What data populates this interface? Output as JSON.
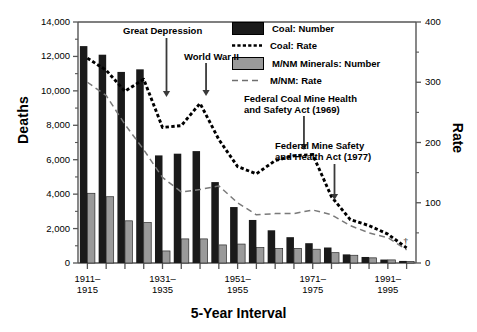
{
  "chart_data": {
    "type": "bar",
    "title": "",
    "xlabel": "5-Year Interval",
    "ylabel": "Deaths",
    "ylabel_right": "Rate",
    "ylim": [
      0,
      14000
    ],
    "ylim_right": [
      0,
      400
    ],
    "ytick_labels": [
      "0",
      "2,000",
      "4,000",
      "6,000",
      "8,000",
      "10,000",
      "12,000",
      "14,000"
    ],
    "ytick_values": [
      0,
      2000,
      4000,
      6000,
      8000,
      10000,
      12000,
      14000
    ],
    "ytick_labels_right": [
      "0",
      "100",
      "200",
      "300",
      "400"
    ],
    "ytick_values_right": [
      0,
      100,
      200,
      300,
      400
    ],
    "grid": false,
    "legend_position": "top-right",
    "categories": [
      "1911-1915",
      "1916-1920",
      "1921-1925",
      "1926-1930",
      "1931-1935",
      "1936-1940",
      "1941-1945",
      "1946-1950",
      "1951-1955",
      "1956-1960",
      "1961-1965",
      "1966-1970",
      "1971-1975",
      "1976-1980",
      "1981-1985",
      "1986-1990",
      "1991-1995",
      "1996-2000"
    ],
    "xtick_labels": [
      {
        "index": 0,
        "line1": "1911–",
        "line2": "1915"
      },
      {
        "index": 4,
        "line1": "1931–",
        "line2": "1935"
      },
      {
        "index": 8,
        "line1": "1951–",
        "line2": "1955"
      },
      {
        "index": 12,
        "line1": "1971–",
        "line2": "1975"
      },
      {
        "index": 16,
        "line1": "1991–",
        "line2": "1995"
      }
    ],
    "series": [
      {
        "name": "Coal: Number",
        "type": "bar",
        "axis": "left",
        "color": "#1a1a1a",
        "values": [
          12600,
          12100,
          11100,
          11250,
          6250,
          6350,
          6500,
          4700,
          3250,
          2500,
          1900,
          1500,
          1150,
          900,
          500,
          350,
          200,
          120
        ]
      },
      {
        "name": "M/NM Minerals: Number",
        "type": "bar",
        "axis": "left",
        "color": "#9a9a9a",
        "values": [
          4050,
          3850,
          2450,
          2350,
          700,
          1400,
          1400,
          1050,
          1100,
          900,
          850,
          850,
          800,
          600,
          450,
          300,
          180,
          90
        ]
      },
      {
        "name": "Coal: Rate",
        "type": "line",
        "axis": "right",
        "style": "dotted",
        "color": "#000000",
        "values": [
          340,
          320,
          285,
          305,
          225,
          228,
          265,
          205,
          160,
          148,
          170,
          178,
          180,
          110,
          72,
          62,
          48,
          25
        ]
      },
      {
        "name": "M/NM: Rate",
        "type": "line",
        "axis": "right",
        "style": "dashed",
        "color": "#7a7a7a",
        "values": [
          300,
          278,
          230,
          188,
          142,
          118,
          122,
          128,
          100,
          80,
          82,
          82,
          88,
          80,
          62,
          50,
          42,
          22
        ]
      }
    ],
    "annotations": [
      {
        "id": "great-depression",
        "text": "Great Depression",
        "arrow_to_index": 4
      },
      {
        "id": "world-war-ii",
        "text": "World War II",
        "arrow_to_index": 6
      },
      {
        "id": "federal-coal-mine-health-act",
        "line1": "Federal Coal Mine Health",
        "line2": "and Safety Act (1969)",
        "arrow_to_index": 11
      },
      {
        "id": "federal-mine-safety-health-act",
        "line1": "Federal Mine Safety",
        "line2": "and Health Act (1977)",
        "arrow_to_index": 13
      }
    ],
    "legend": [
      {
        "label": "Coal: Number",
        "key": "filled-dark-swatch"
      },
      {
        "label": "Coal: Rate",
        "key": "dotted-line"
      },
      {
        "label": "M/NM Minerals: Number",
        "key": "filled-gray-swatch"
      },
      {
        "label": "M/NM: Rate",
        "key": "dashed-line"
      }
    ],
    "footnote_marker": "†"
  },
  "colors": {
    "coal_bar": "#1a1a1a",
    "mnm_bar": "#9a9a9a",
    "coal_rate_line": "#000000",
    "mnm_rate_line": "#7a7a7a",
    "axis": "#555555"
  }
}
